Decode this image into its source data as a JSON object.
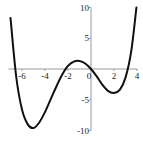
{
  "chart_data": {
    "type": "line",
    "title": "",
    "xlabel": "",
    "ylabel": "",
    "xlim": [
      -7,
      4
    ],
    "ylim": [
      -10,
      10
    ],
    "grid": false,
    "legend": null,
    "x_ticks": [
      -6,
      -4,
      -2,
      0,
      2,
      4
    ],
    "x_tick_labels": [
      "-6",
      "-4",
      "-2",
      "0",
      "2",
      "4"
    ],
    "y_ticks": [
      -10,
      -5,
      5,
      10
    ],
    "y_tick_labels": [
      "-10",
      "-5",
      "5",
      "10"
    ],
    "series": [
      {
        "name": "f(x)",
        "color": "#111111",
        "x": [
          -7,
          -6.5,
          -6,
          -5.5,
          -5,
          -4.5,
          -4,
          -3.5,
          -3,
          -2.5,
          -2,
          -1.5,
          -1,
          -0.5,
          0,
          0.5,
          1,
          1.5,
          2,
          2.5,
          3,
          3.5,
          3.95
        ],
        "y": [
          8.3,
          -1.3,
          -6.6,
          -9.0,
          -9.6,
          -8.7,
          -7.0,
          -4.9,
          -2.8,
          -0.9,
          0.5,
          1.2,
          1.3,
          0.9,
          0,
          -1.2,
          -2.6,
          -3.6,
          -3.9,
          -3.4,
          -1.4,
          2.9,
          10.0
        ]
      }
    ],
    "annotations": {
      "roots": [
        -6.6,
        -2.2,
        0,
        3.2
      ],
      "local_min_left": [
        -5,
        -9.6
      ],
      "local_max": [
        -1,
        1.3
      ],
      "local_min_right": [
        2,
        -3.9
      ]
    }
  }
}
